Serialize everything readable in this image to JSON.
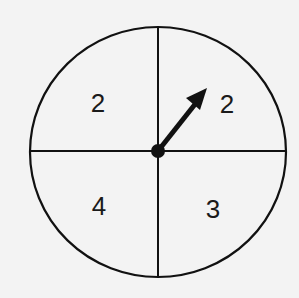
{
  "spinner": {
    "sections": [
      {
        "position": "top-left",
        "label": "2"
      },
      {
        "position": "top-right",
        "label": "2"
      },
      {
        "position": "bottom-left",
        "label": "4"
      },
      {
        "position": "bottom-right",
        "label": "3"
      }
    ],
    "arrow": {
      "points_to": "top-right"
    },
    "colors": {
      "stroke": "#111111",
      "background": "#f3f3f3"
    }
  }
}
